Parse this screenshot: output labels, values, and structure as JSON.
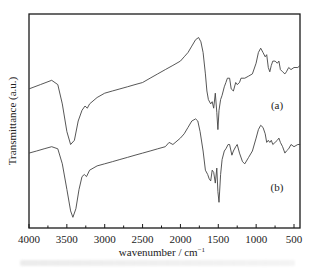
{
  "chart_data": {
    "type": "line",
    "title": "",
    "xlabel": "wavenumber / cm",
    "xlabel_superscript": "−1",
    "ylabel": "Transmittance (a.u.)",
    "xlim": [
      4000,
      400
    ],
    "ylim": [
      0,
      100
    ],
    "x_reversed": true,
    "xticks": [
      4000,
      3500,
      3000,
      2500,
      2000,
      1500,
      1000,
      500
    ],
    "xtick_labels": [
      "4000",
      "3500",
      "3000",
      "2500",
      "2000",
      "1500",
      "1000",
      "500"
    ],
    "yticks_shown": false,
    "grid": false,
    "legend": "none",
    "series": [
      {
        "name": "(a)",
        "label_position": "right",
        "x": [
          4000,
          3850,
          3700,
          3620,
          3560,
          3500,
          3450,
          3400,
          3350,
          3300,
          3260,
          3230,
          3200,
          3100,
          3000,
          2900,
          2800,
          2700,
          2600,
          2500,
          2400,
          2300,
          2200,
          2100,
          2000,
          1950,
          1900,
          1850,
          1800,
          1760,
          1730,
          1700,
          1670,
          1650,
          1630,
          1600,
          1580,
          1560,
          1540,
          1520,
          1505,
          1490,
          1470,
          1450,
          1420,
          1400,
          1380,
          1350,
          1330,
          1300,
          1270,
          1250,
          1220,
          1200,
          1150,
          1100,
          1050,
          1000,
          970,
          940,
          910,
          880,
          860,
          840,
          820,
          800,
          780,
          750,
          720,
          700,
          680,
          650,
          620,
          600,
          570,
          540,
          500,
          450,
          420
        ],
        "y": [
          65,
          67,
          69,
          67,
          58,
          45,
          39,
          41,
          50,
          55,
          57,
          56,
          58,
          61,
          63,
          64,
          65,
          66,
          67,
          68,
          70,
          72,
          74,
          76,
          78,
          80,
          82,
          85,
          88,
          89,
          87,
          82,
          72,
          64,
          60,
          58,
          59,
          56,
          63,
          54,
          46,
          55,
          60,
          62,
          66,
          68,
          70,
          70,
          65,
          64,
          68,
          67,
          68,
          70,
          70,
          71,
          72,
          77,
          82,
          84,
          82,
          80,
          81,
          75,
          73,
          76,
          78,
          78,
          77,
          78,
          74,
          73,
          72,
          73,
          75,
          74,
          75,
          75,
          76
        ]
      },
      {
        "name": "(b)",
        "label_position": "right",
        "x": [
          4000,
          3900,
          3800,
          3700,
          3620,
          3560,
          3500,
          3450,
          3420,
          3380,
          3340,
          3300,
          3270,
          3240,
          3200,
          3100,
          3000,
          2900,
          2800,
          2700,
          2600,
          2500,
          2400,
          2300,
          2200,
          2150,
          2100,
          2000,
          1950,
          1900,
          1850,
          1800,
          1770,
          1740,
          1700,
          1670,
          1640,
          1620,
          1600,
          1580,
          1560,
          1540,
          1520,
          1505,
          1490,
          1470,
          1450,
          1420,
          1400,
          1370,
          1350,
          1320,
          1300,
          1270,
          1250,
          1220,
          1180,
          1150,
          1100,
          1050,
          1000,
          970,
          940,
          910,
          880,
          860,
          840,
          820,
          800,
          780,
          750,
          720,
          700,
          680,
          650,
          620,
          600,
          570,
          540,
          500,
          450,
          420
        ],
        "y": [
          35,
          36,
          37,
          38,
          37,
          30,
          18,
          8,
          5,
          9,
          18,
          24,
          25,
          24,
          27,
          29,
          30,
          31,
          32,
          33,
          34,
          35,
          36,
          37,
          38,
          40,
          39,
          42,
          44,
          47,
          50,
          51,
          50,
          45,
          36,
          27,
          25,
          23,
          22,
          27,
          26,
          21,
          28,
          17,
          12,
          25,
          32,
          36,
          37,
          39,
          39,
          34,
          36,
          38,
          39,
          35,
          31,
          30,
          33,
          36,
          42,
          46,
          48,
          47,
          44,
          40,
          41,
          40,
          41,
          39,
          40,
          41,
          42,
          40,
          38,
          35,
          36,
          37,
          39,
          38,
          39,
          39
        ]
      }
    ]
  },
  "caption": ""
}
